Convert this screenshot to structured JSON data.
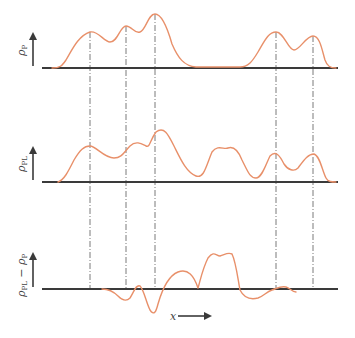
{
  "figure": {
    "panels": [
      {
        "id": "top",
        "label_main": "ρ",
        "label_sub": "P",
        "axis_y": 68
      },
      {
        "id": "middle",
        "label_main": "ρ",
        "label_sub": "PL",
        "axis_y": 182
      },
      {
        "id": "bottom",
        "label_main": "ρ",
        "label_sub": "PL",
        "label_minus": " − ",
        "label_main2": "ρ",
        "label_sub2": "P",
        "axis_y": 289
      }
    ],
    "x_axis_label": "x",
    "vertical_marker_x": [
      90,
      126,
      155,
      276,
      313
    ],
    "curve_color": "#e8906a",
    "axis_color": "#3a3a3a"
  }
}
